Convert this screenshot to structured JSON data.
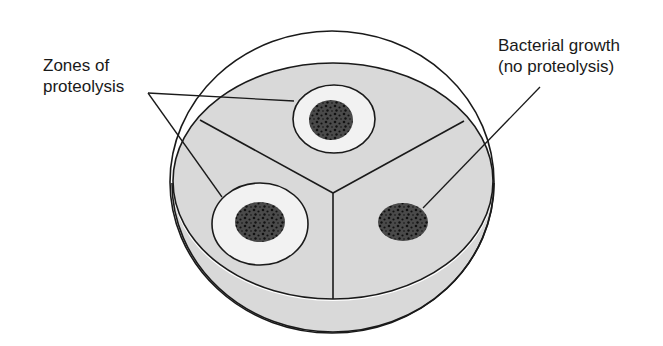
{
  "figure": {
    "type": "petri-dish-diagram",
    "colors": {
      "background": "#ffffff",
      "agar": "#d9d9d9",
      "clear_zone": "#f2f2f2",
      "colony": "#4a4a4a",
      "speckle": "#111111",
      "stroke": "#1a1a1a"
    }
  },
  "labels": {
    "zones_line1": "Zones of",
    "zones_line2": "proteolysis",
    "growth_line1": "Bacterial growth",
    "growth_line2": "(no proteolysis)"
  },
  "colonies": [
    {
      "name": "top-colony",
      "proteolysis": true
    },
    {
      "name": "left-colony",
      "proteolysis": true
    },
    {
      "name": "right-colony",
      "proteolysis": false
    }
  ]
}
